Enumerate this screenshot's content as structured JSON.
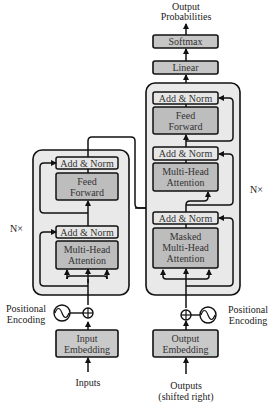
{
  "diagram": {
    "colors": {
      "outer_stack_fill": "#e9e9e9",
      "sublayer_fill": "#bdbdbd",
      "addnorm_fill": "#e6e6e6",
      "linear_softmax_fill": "#c6c6c6",
      "embedding_fill": "#c9c9c9",
      "stroke": "#111111"
    },
    "encoder": {
      "repeat_label": "N×",
      "add_norm_top": "Add & Norm",
      "feed_forward": [
        "Feed",
        "Forward"
      ],
      "add_norm_bottom": "Add & Norm",
      "attention": [
        "Multi-Head",
        "Attention"
      ],
      "positional_encoding": [
        "Positional",
        "Encoding"
      ],
      "embedding": [
        "Input",
        "Embedding"
      ],
      "input_label": "Inputs"
    },
    "decoder": {
      "repeat_label": "N×",
      "add_norm_top": "Add & Norm",
      "feed_forward": [
        "Feed",
        "Forward"
      ],
      "add_norm_mid": "Add & Norm",
      "attention": [
        "Multi-Head",
        "Attention"
      ],
      "add_norm_bottom": "Add & Norm",
      "masked_attention": [
        "Masked",
        "Multi-Head",
        "Attention"
      ],
      "positional_encoding": [
        "Positional",
        "Encoding"
      ],
      "embedding": [
        "Output",
        "Embedding"
      ],
      "input_label": [
        "Outputs",
        "(shifted right)"
      ]
    },
    "head": {
      "linear": "Linear",
      "softmax": "Softmax",
      "output_label": [
        "Output",
        "Probabilities"
      ]
    }
  }
}
